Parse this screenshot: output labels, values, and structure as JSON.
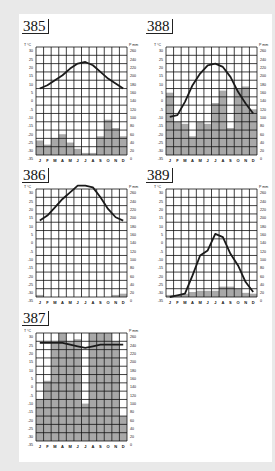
{
  "page": {
    "background": "#e9e9e9",
    "sheet": "#ffffff"
  },
  "axes": {
    "left_unit": "T °C",
    "right_unit": "P mm",
    "temp_ticks": [
      "30",
      "25",
      "20",
      "15",
      "10",
      "5",
      "0",
      "-5",
      "-10",
      "-15",
      "-20",
      "-25",
      "-30",
      "-35"
    ],
    "precip_ticks": [
      "260",
      "240",
      "220",
      "200",
      "180",
      "160",
      "140",
      "120",
      "100",
      "80",
      "60",
      "40",
      "20",
      "0"
    ],
    "months": [
      "J",
      "F",
      "M",
      "A",
      "M",
      "J",
      "J",
      "A",
      "S",
      "O",
      "N",
      "D"
    ]
  },
  "colors": {
    "grid": "#111111",
    "bars": "#a8a8a8",
    "line": "#1a1a1a"
  },
  "diagrams": [
    {
      "id": "385",
      "label": "385"
    },
    {
      "id": "388",
      "label": "388"
    },
    {
      "id": "386",
      "label": "386"
    },
    {
      "id": "389",
      "label": "389"
    },
    {
      "id": "387",
      "label": "387"
    }
  ],
  "chart_data": [
    {
      "type": "bar+line",
      "title": "385",
      "categories": [
        "J",
        "F",
        "M",
        "A",
        "M",
        "J",
        "J",
        "A",
        "S",
        "O",
        "N",
        "D"
      ],
      "ylabel_left": "T °C",
      "ylim_left": [
        -35,
        30
      ],
      "ylabel_right": "P mm",
      "ylim_right": [
        0,
        260
      ],
      "series": [
        {
          "name": "Temperature (°C)",
          "type": "line",
          "values": [
            5,
            7,
            10,
            13,
            17,
            20,
            21,
            19,
            15,
            11,
            8,
            5
          ]
        },
        {
          "name": "Precipitation (mm)",
          "type": "bar",
          "values": [
            35,
            25,
            40,
            50,
            30,
            15,
            5,
            5,
            45,
            85,
            65,
            45
          ]
        }
      ],
      "grid": true
    },
    {
      "type": "bar+line",
      "title": "388",
      "categories": [
        "J",
        "F",
        "M",
        "A",
        "M",
        "J",
        "J",
        "A",
        "S",
        "O",
        "N",
        "D"
      ],
      "ylabel_left": "T °C",
      "ylim_left": [
        -35,
        30
      ],
      "ylabel_right": "P mm",
      "ylim_right": [
        0,
        260
      ],
      "series": [
        {
          "name": "Temperature (°C)",
          "type": "line",
          "values": [
            -12,
            -11,
            -3,
            7,
            14,
            19,
            20,
            18,
            12,
            3,
            -4,
            -10
          ]
        },
        {
          "name": "Precipitation (mm)",
          "type": "bar",
          "values": [
            150,
            80,
            75,
            45,
            80,
            75,
            125,
            155,
            65,
            160,
            165,
            110
          ]
        }
      ],
      "grid": true
    },
    {
      "type": "bar+line",
      "title": "386",
      "categories": [
        "J",
        "F",
        "M",
        "A",
        "M",
        "J",
        "J",
        "A",
        "S",
        "O",
        "N",
        "D"
      ],
      "ylabel_left": "T °C",
      "ylim_left": [
        -35,
        30
      ],
      "ylabel_right": "P mm",
      "ylim_right": [
        0,
        260
      ],
      "series": [
        {
          "name": "Temperature (°C)",
          "type": "line",
          "values": [
            11,
            14,
            19,
            24,
            28,
            32,
            32,
            31,
            25,
            18,
            13,
            11
          ]
        },
        {
          "name": "Precipitation (mm)",
          "type": "bar",
          "values": [
            5,
            0,
            0,
            0,
            0,
            0,
            0,
            0,
            0,
            0,
            5,
            8
          ]
        }
      ],
      "grid": true
    },
    {
      "type": "bar+line",
      "title": "389",
      "categories": [
        "J",
        "F",
        "M",
        "A",
        "M",
        "J",
        "J",
        "A",
        "S",
        "O",
        "N",
        "D"
      ],
      "ylabel_left": "T °C",
      "ylim_left": [
        -35,
        30
      ],
      "ylabel_right": "P mm",
      "ylim_right": [
        0,
        260
      ],
      "series": [
        {
          "name": "Temperature (°C)",
          "type": "line",
          "values": [
            -35,
            -34,
            -33,
            -22,
            -10,
            -7,
            3,
            1,
            -9,
            -16,
            -26,
            -32
          ]
        },
        {
          "name": "Precipitation (mm)",
          "type": "bar",
          "values": [
            5,
            5,
            8,
            12,
            15,
            15,
            15,
            25,
            25,
            20,
            10,
            8
          ]
        }
      ],
      "grid": true
    },
    {
      "type": "bar+line",
      "title": "387",
      "categories": [
        "J",
        "F",
        "M",
        "A",
        "M",
        "J",
        "J",
        "A",
        "S",
        "O",
        "N",
        "D"
      ],
      "ylabel_left": "T °C",
      "ylim_left": [
        -35,
        30
      ],
      "ylabel_right": "P mm",
      "ylim_right": [
        0,
        260
      ],
      "series": [
        {
          "name": "Temperature (°C)",
          "type": "line",
          "values": [
            24,
            24,
            24,
            24,
            23,
            22,
            21,
            22,
            23,
            23,
            23,
            23
          ]
        },
        {
          "name": "Precipitation (mm)",
          "type": "bar",
          "values": [
            100,
            145,
            235,
            260,
            240,
            245,
            90,
            260,
            260,
            260,
            240,
            60
          ]
        }
      ],
      "grid": true
    }
  ]
}
